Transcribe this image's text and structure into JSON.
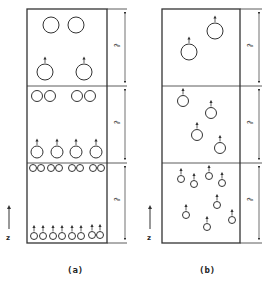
{
  "figure": {
    "panels": [
      {
        "id": "a",
        "label": "(a)",
        "axis_label": "z",
        "section_label": "ℓ",
        "frame": {
          "x": 27,
          "y": 9,
          "w": 80,
          "h": 234,
          "ext_x": 127,
          "arrow_x": 125
        },
        "dividers_y": [
          86,
          163
        ],
        "circles": [
          {
            "cx": 51,
            "cy": 25,
            "r": 8,
            "arrow": false
          },
          {
            "cx": 76,
            "cy": 25,
            "r": 8,
            "arrow": false
          },
          {
            "cx": 45,
            "cy": 72,
            "r": 8,
            "arrow": true
          },
          {
            "cx": 84,
            "cy": 72,
            "r": 8,
            "arrow": true
          },
          {
            "cx": 37,
            "cy": 96,
            "r": 5.5,
            "arrow": false
          },
          {
            "cx": 50,
            "cy": 96,
            "r": 5.5,
            "arrow": false
          },
          {
            "cx": 77,
            "cy": 96,
            "r": 5.5,
            "arrow": false
          },
          {
            "cx": 90,
            "cy": 96,
            "r": 5.5,
            "arrow": false
          },
          {
            "cx": 37,
            "cy": 152,
            "r": 6,
            "arrow": true
          },
          {
            "cx": 57,
            "cy": 152,
            "r": 6,
            "arrow": true
          },
          {
            "cx": 76,
            "cy": 152,
            "r": 6,
            "arrow": true
          },
          {
            "cx": 96,
            "cy": 152,
            "r": 6,
            "arrow": true
          },
          {
            "cx": 33,
            "cy": 168,
            "r": 3.5,
            "arrow": false
          },
          {
            "cx": 41,
            "cy": 168,
            "r": 3.5,
            "arrow": false
          },
          {
            "cx": 51,
            "cy": 168,
            "r": 3.5,
            "arrow": false
          },
          {
            "cx": 59,
            "cy": 168,
            "r": 3.5,
            "arrow": false
          },
          {
            "cx": 72,
            "cy": 168,
            "r": 3.5,
            "arrow": false
          },
          {
            "cx": 80,
            "cy": 168,
            "r": 3.5,
            "arrow": false
          },
          {
            "cx": 93,
            "cy": 168,
            "r": 3.5,
            "arrow": false
          },
          {
            "cx": 101,
            "cy": 168,
            "r": 3.5,
            "arrow": false
          },
          {
            "cx": 34,
            "cy": 236,
            "r": 3.5,
            "arrow": true
          },
          {
            "cx": 43,
            "cy": 236,
            "r": 3.5,
            "arrow": true
          },
          {
            "cx": 53,
            "cy": 236,
            "r": 3.5,
            "arrow": true
          },
          {
            "cx": 62,
            "cy": 236,
            "r": 3.5,
            "arrow": true
          },
          {
            "cx": 72,
            "cy": 236,
            "r": 3.5,
            "arrow": true
          },
          {
            "cx": 81,
            "cy": 236,
            "r": 3.5,
            "arrow": true
          },
          {
            "cx": 92,
            "cy": 235,
            "r": 3.5,
            "arrow": true
          },
          {
            "cx": 100,
            "cy": 235,
            "r": 3.5,
            "arrow": true
          }
        ]
      },
      {
        "id": "b",
        "label": "(b)",
        "axis_label": "z",
        "section_label": "ℓ",
        "frame": {
          "x": 162,
          "y": 9,
          "w": 78,
          "h": 234,
          "ext_x": 262,
          "arrow_x": 259
        },
        "dividers_y": [
          86,
          163
        ],
        "circles": [
          {
            "cx": 215,
            "cy": 31,
            "r": 8,
            "arrow": true
          },
          {
            "cx": 189,
            "cy": 52,
            "r": 8,
            "arrow": true
          },
          {
            "cx": 183,
            "cy": 101,
            "r": 5.5,
            "arrow": true
          },
          {
            "cx": 211,
            "cy": 113,
            "r": 5.5,
            "arrow": true
          },
          {
            "cx": 197,
            "cy": 135,
            "r": 5.5,
            "arrow": true
          },
          {
            "cx": 220,
            "cy": 148,
            "r": 5.5,
            "arrow": true
          },
          {
            "cx": 181,
            "cy": 179,
            "r": 3.5,
            "arrow": true
          },
          {
            "cx": 194,
            "cy": 184,
            "r": 3.5,
            "arrow": true
          },
          {
            "cx": 209,
            "cy": 176,
            "r": 3.5,
            "arrow": true
          },
          {
            "cx": 222,
            "cy": 183,
            "r": 3.5,
            "arrow": true
          },
          {
            "cx": 217,
            "cy": 205,
            "r": 3.5,
            "arrow": true
          },
          {
            "cx": 186,
            "cy": 215,
            "r": 3.5,
            "arrow": true
          },
          {
            "cx": 207,
            "cy": 227,
            "r": 3.5,
            "arrow": true
          },
          {
            "cx": 232,
            "cy": 220,
            "r": 3.5,
            "arrow": true
          }
        ]
      }
    ],
    "stroke_color": "#333333"
  }
}
